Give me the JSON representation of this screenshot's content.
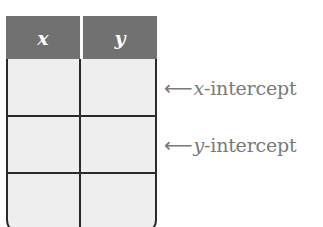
{
  "table": {
    "headers": [
      {
        "label": "x"
      },
      {
        "label": "y"
      }
    ],
    "rows": [
      {
        "x": "",
        "y": ""
      },
      {
        "x": "",
        "y": ""
      },
      {
        "x": "",
        "y": ""
      }
    ],
    "colors": {
      "header_fill": "#717171",
      "header_text": "#ffffff",
      "body_fill": "#eeeeee",
      "grid_line": "#2a2a2a"
    }
  },
  "annotations": [
    {
      "arrow": "⟵",
      "variable": "x",
      "suffix": "-intercept",
      "row_index": 0
    },
    {
      "arrow": "⟵",
      "variable": "y",
      "suffix": "-intercept",
      "row_index": 1
    }
  ],
  "annotation_color": "#7a7a7a"
}
